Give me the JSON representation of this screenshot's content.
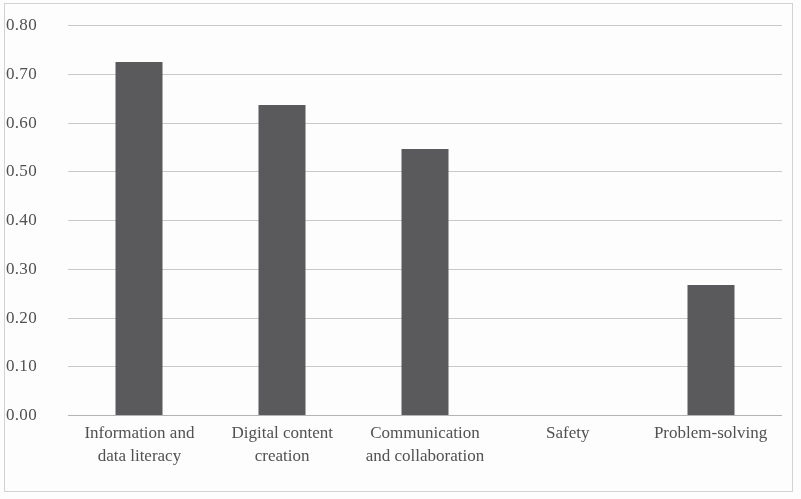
{
  "chart_data": {
    "type": "bar",
    "title": "",
    "subtitle": "",
    "xlabel": "",
    "ylabel": "",
    "categories": [
      "Information and data literacy",
      "Digital content creation",
      "Communication and collaboration",
      "Safety",
      "Problem-solving"
    ],
    "category_lines": [
      [
        "Information and",
        "data literacy"
      ],
      [
        "Digital content",
        "creation"
      ],
      [
        "Communication",
        "and collaboration"
      ],
      [
        "Safety",
        ""
      ],
      [
        "Problem-solving",
        ""
      ]
    ],
    "values": [
      0.725,
      0.635,
      0.545,
      0.0,
      0.267
    ],
    "ylim": [
      0.0,
      0.8
    ],
    "ytick_values": [
      0.8,
      0.7,
      0.6,
      0.5,
      0.4,
      0.3,
      0.2,
      0.1,
      0.0
    ],
    "ytick_labels": [
      "0.80",
      "0.70",
      "0.60",
      "0.50",
      "0.40",
      "0.30",
      "0.20",
      "0.10",
      "0.00"
    ],
    "grid": true,
    "grid_axis": "y",
    "legend": false,
    "legend_position": "none",
    "bar_color": "#58585a",
    "gridline_color": "#c9c9c9",
    "axis_color": "#b4b4b4",
    "background_color": "#ffffff"
  }
}
